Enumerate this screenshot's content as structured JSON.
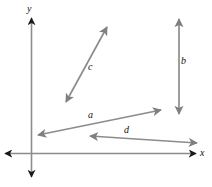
{
  "figure": {
    "type": "vector-diagram",
    "width": 212,
    "height": 187,
    "background": "#ffffff",
    "axis_color": "#8c8c8c",
    "arrowhead_color": "#1a1a1a",
    "vector_color": "#8c8c8c",
    "label_color": "#111111"
  },
  "axes": {
    "origin": {
      "x": 31,
      "y": 153
    },
    "x_axis": {
      "label": "x",
      "label_pos": {
        "x": 200,
        "y": 149
      },
      "start": {
        "x": 5,
        "y": 153
      },
      "end": {
        "x": 196,
        "y": 153
      },
      "double_headed": true
    },
    "y_axis": {
      "label": "y",
      "label_pos": {
        "x": 27,
        "y": 5
      },
      "start": {
        "x": 31,
        "y": 177
      },
      "end": {
        "x": 31,
        "y": 18
      },
      "double_headed": true
    }
  },
  "vectors": [
    {
      "id": "a",
      "label": "a",
      "label_pos": {
        "x": 88,
        "y": 111
      },
      "start": {
        "x": 38,
        "y": 135
      },
      "end": {
        "x": 161,
        "y": 110
      },
      "double_headed": true,
      "orientation": "up-right shallow"
    },
    {
      "id": "b",
      "label": "b",
      "label_pos": {
        "x": 182,
        "y": 57
      },
      "start": {
        "x": 179,
        "y": 114
      },
      "end": {
        "x": 179,
        "y": 19
      },
      "double_headed": true,
      "orientation": "vertical"
    },
    {
      "id": "c",
      "label": "c",
      "label_pos": {
        "x": 88,
        "y": 63
      },
      "start": {
        "x": 66,
        "y": 102
      },
      "end": {
        "x": 107,
        "y": 27
      },
      "double_headed": true,
      "orientation": "up-right steep"
    },
    {
      "id": "d",
      "label": "d",
      "label_pos": {
        "x": 125,
        "y": 126
      },
      "start": {
        "x": 197,
        "y": 143
      },
      "end": {
        "x": 90,
        "y": 136
      },
      "double_headed": true,
      "orientation": "left shallow"
    }
  ]
}
